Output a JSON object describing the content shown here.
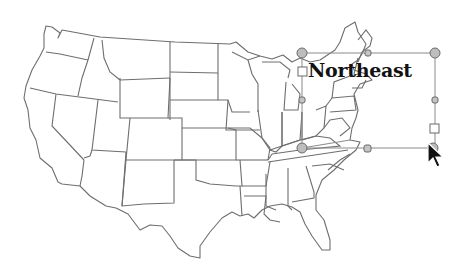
{
  "canvas": {
    "background": "#ffffff",
    "map_stroke": "#6e6e6e",
    "map_description": "Outline map of the contiguous United States"
  },
  "text_box": {
    "label": "Northeast",
    "selected": true
  },
  "selection": {
    "line_color": "#8a8a8a",
    "handle_fill": "#bdbdbd"
  },
  "cursor": {
    "type": "arrow"
  }
}
